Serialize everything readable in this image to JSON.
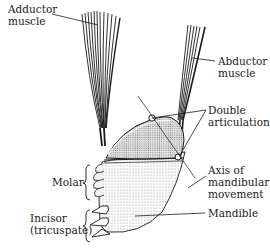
{
  "diagram": {
    "labels": {
      "adductor_line1": "Adductor",
      "adductor_line2": "muscle",
      "abductor_line1": "Abductor",
      "abductor_line2": "muscle",
      "double_line1": "Double",
      "double_line2": "articulation",
      "axis_line1": "Axis of",
      "axis_line2": "mandibular",
      "axis_line3": "movement",
      "molar": "Molar",
      "incisor_line1": "Incisor",
      "incisor_line2": "(tricuspate)",
      "mandible": "Mandible"
    },
    "colors": {
      "ink": "#1a1a1a",
      "shade": "#d9d9d9",
      "background": "#ffffff"
    }
  }
}
